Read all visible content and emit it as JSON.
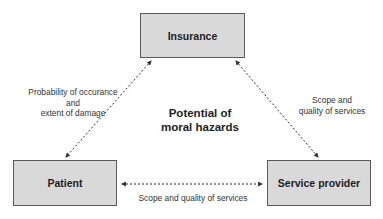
{
  "diagram": {
    "nodes": {
      "insurance": {
        "label": "Insurance"
      },
      "patient": {
        "label": "Patient"
      },
      "provider": {
        "label": "Service provider"
      }
    },
    "edges": [
      {
        "from": "insurance",
        "to": "patient",
        "style": "dashed-bidirectional",
        "label": "Probability of occurance\nand\nextent of damage"
      },
      {
        "from": "insurance",
        "to": "provider",
        "style": "dashed-bidirectional",
        "label": "Scope and\nquality of services"
      },
      {
        "from": "patient",
        "to": "provider",
        "style": "dashed-bidirectional",
        "label": "Scope and quality of services"
      }
    ],
    "labels": {
      "left_line1": "Probability of occurance",
      "left_line2": "and",
      "left_line3": "extent of damage",
      "right_line1": "Scope and",
      "right_line2": "quality of services",
      "bottom": "Scope and quality of services"
    },
    "center_title": {
      "line1": "Potential of",
      "line2": "moral hazards"
    },
    "colors": {
      "box_fill": "#d9d9d9",
      "box_border": "#5a5a5a",
      "arrow": "#333333",
      "text": "#1e1e1e"
    }
  }
}
